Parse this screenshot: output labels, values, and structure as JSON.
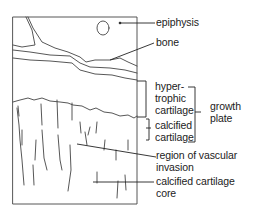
{
  "diagram": {
    "type": "anatomical illustration",
    "labels": {
      "epiphysis": "epiphysis",
      "bone": "bone",
      "hypertrophic_1": "hyper-",
      "hypertrophic_2": "trophic",
      "hypertrophic_3": "cartilage",
      "calcified_1": "calcified",
      "calcified_2": "cartilage",
      "growth_1": "growth",
      "growth_2": "plate",
      "vascular_1": "region of vascular",
      "vascular_2": "invasion",
      "core_1": "calcified cartilage",
      "core_2": "core"
    },
    "line_color": "#333333"
  }
}
